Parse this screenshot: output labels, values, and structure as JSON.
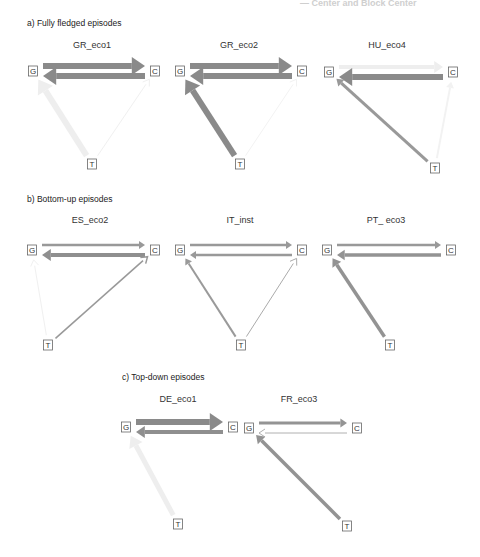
{
  "header_cut_text": "— Center and Block Center",
  "sections": [
    {
      "label": "a) Fully fledged episodes",
      "pos": [
        27,
        26
      ],
      "panels": [
        {
          "title": "GR_eco1",
          "title_pos": [
            92,
            48
          ],
          "nodes": {
            "G": [
              33,
              71
            ],
            "C": [
              155,
              71
            ],
            "T": [
              92,
              164
            ]
          },
          "edges": [
            {
              "from": "G",
              "to": "C",
              "width": 6,
              "color": "#8a8a8a",
              "offset": -5
            },
            {
              "from": "C",
              "to": "G",
              "width": 6,
              "color": "#8a8a8a",
              "offset": 5
            },
            {
              "from": "T",
              "to": "G",
              "width": 6,
              "color": "#eeeeee",
              "offset": 0
            },
            {
              "from": "T",
              "to": "C",
              "width": 1,
              "color": "#f0f0f0",
              "offset": 0
            }
          ]
        },
        {
          "title": "GR_eco2",
          "title_pos": [
            239,
            48
          ],
          "nodes": {
            "G": [
              180,
              71
            ],
            "C": [
              302,
              71
            ],
            "T": [
              240,
              164
            ]
          },
          "edges": [
            {
              "from": "G",
              "to": "C",
              "width": 6,
              "color": "#8a8a8a",
              "offset": -5
            },
            {
              "from": "C",
              "to": "G",
              "width": 6,
              "color": "#8a8a8a",
              "offset": 5
            },
            {
              "from": "T",
              "to": "G",
              "width": 6,
              "color": "#8a8a8a",
              "offset": 0
            },
            {
              "from": "T",
              "to": "C",
              "width": 1,
              "color": "#f2f2f2",
              "offset": 0
            }
          ]
        },
        {
          "title": "HU_eco4",
          "title_pos": [
            387,
            48
          ],
          "nodes": {
            "G": [
              329,
              72
            ],
            "C": [
              453,
              72
            ],
            "T": [
              435,
              168
            ]
          },
          "edges": [
            {
              "from": "G",
              "to": "C",
              "width": 4,
              "color": "#eeeeee",
              "offset": -5
            },
            {
              "from": "C",
              "to": "G",
              "width": 6,
              "color": "#8a8a8a",
              "offset": 5
            },
            {
              "from": "T",
              "to": "G",
              "width": 3,
              "color": "#999999",
              "offset": 0
            },
            {
              "from": "T",
              "to": "C",
              "width": 2,
              "color": "#f2f2f2",
              "offset": 0
            }
          ]
        }
      ]
    },
    {
      "label": "b) Bottom-up episodes",
      "pos": [
        27,
        202
      ],
      "panels": [
        {
          "title": "ES_eco2",
          "title_pos": [
            90,
            223
          ],
          "nodes": {
            "G": [
              32,
              250
            ],
            "C": [
              155,
              250
            ],
            "T": [
              48,
              345
            ]
          },
          "edges": [
            {
              "from": "G",
              "to": "C",
              "width": 2.5,
              "color": "#999999",
              "offset": -5
            },
            {
              "from": "C",
              "to": "G",
              "width": 4,
              "color": "#8f8f8f",
              "offset": 5
            },
            {
              "from": "T",
              "to": "G",
              "width": 1,
              "color": "#f0f0f0",
              "offset": 0
            },
            {
              "from": "T",
              "to": "C",
              "width": 1.5,
              "color": "#999999",
              "offset": 0
            }
          ]
        },
        {
          "title": "IT_inst",
          "title_pos": [
            240,
            223
          ],
          "nodes": {
            "G": [
              180,
              250
            ],
            "C": [
              302,
              250
            ],
            "T": [
              241,
              345
            ]
          },
          "edges": [
            {
              "from": "G",
              "to": "C",
              "width": 2.5,
              "color": "#999999",
              "offset": -5
            },
            {
              "from": "C",
              "to": "G",
              "width": 2.5,
              "color": "#999999",
              "offset": 5
            },
            {
              "from": "T",
              "to": "G",
              "width": 2,
              "color": "#9a9a9a",
              "offset": 0
            },
            {
              "from": "T",
              "to": "C",
              "width": 1,
              "color": "#aaaaaa",
              "offset": 0
            }
          ]
        },
        {
          "title": "PT_ eco3",
          "title_pos": [
            386,
            223
          ],
          "nodes": {
            "G": [
              327,
              250
            ],
            "C": [
              451,
              250
            ],
            "T": [
              390,
              345
            ]
          },
          "edges": [
            {
              "from": "G",
              "to": "C",
              "width": 2.5,
              "color": "#999999",
              "offset": -5
            },
            {
              "from": "C",
              "to": "G",
              "width": 3.5,
              "color": "#939393",
              "offset": 5
            },
            {
              "from": "T",
              "to": "G",
              "width": 3.5,
              "color": "#939393",
              "offset": 0
            }
          ]
        }
      ]
    },
    {
      "label": "c) Top-down episodes",
      "pos": [
        122,
        380
      ],
      "panels": [
        {
          "title": "DE_eco1",
          "title_pos": [
            178,
            402
          ],
          "nodes": {
            "G": [
              126,
              427
            ],
            "C": [
              233,
              427
            ],
            "T": [
              178,
              524
            ]
          },
          "edges": [
            {
              "from": "G",
              "to": "C",
              "width": 6,
              "color": "#8a8a8a",
              "offset": -5
            },
            {
              "from": "C",
              "to": "G",
              "width": 4,
              "color": "#8f8f8f",
              "offset": 5
            },
            {
              "from": "T",
              "to": "G",
              "width": 5,
              "color": "#eeeeee",
              "offset": 0
            }
          ]
        },
        {
          "title": "FR_eco3",
          "title_pos": [
            299,
            402
          ],
          "nodes": {
            "G": [
              249,
              428
            ],
            "C": [
              357,
              428
            ],
            "T": [
              347,
              526
            ]
          },
          "edges": [
            {
              "from": "G",
              "to": "C",
              "width": 3,
              "color": "#949494",
              "offset": -5
            },
            {
              "from": "C",
              "to": "G",
              "width": 1,
              "color": "#b0b0b0",
              "offset": 5
            },
            {
              "from": "T",
              "to": "G",
              "width": 3.5,
              "color": "#939393",
              "offset": 0
            }
          ]
        }
      ]
    }
  ],
  "node_labels": {
    "G": "G",
    "C": "C",
    "T": "T"
  }
}
